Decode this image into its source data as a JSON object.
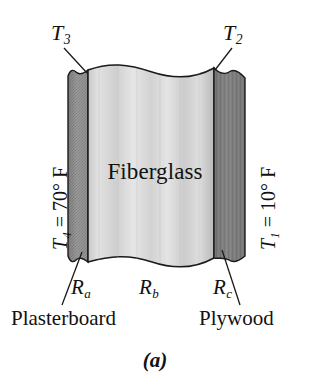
{
  "figure": {
    "caption": "(a)",
    "core_material_label": "Fiberglass"
  },
  "temperatures": {
    "t3": {
      "symbol": "T",
      "subscript": "3",
      "text": "T3"
    },
    "t2": {
      "symbol": "T",
      "subscript": "2",
      "text": "T2"
    },
    "t4": {
      "symbol": "T",
      "subscript": "4",
      "value": "70",
      "unit": "° F",
      "equals": "="
    },
    "t1": {
      "symbol": "T",
      "subscript": "1",
      "value": "10",
      "unit": "° F",
      "equals": "="
    }
  },
  "resistances": {
    "ra": {
      "symbol": "R",
      "subscript": "a"
    },
    "rb": {
      "symbol": "R",
      "subscript": "b"
    },
    "rc": {
      "symbol": "R",
      "subscript": "c"
    }
  },
  "layers": [
    {
      "name": "Plasterboard",
      "resistance": "Ra",
      "fill": "#8e8e8e"
    },
    {
      "name": "Fiberglass",
      "resistance": "Rb",
      "fill": "#d6d6d6"
    },
    {
      "name": "Plywood",
      "resistance": "Rc",
      "fill": "#7d7d7d"
    }
  ],
  "colors": {
    "outline": "#1a1a1a",
    "plasterboard": "#8e8e8e",
    "fiberglass": "#d8d8d8",
    "plywood": "#7d7d7d",
    "background": "#ffffff",
    "text": "#111111"
  }
}
